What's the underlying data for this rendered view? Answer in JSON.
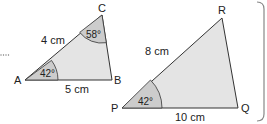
{
  "figure": {
    "triangle1": {
      "vertices": {
        "a": "A",
        "b": "B",
        "c": "C"
      },
      "sides": {
        "ac": "4 cm",
        "ab": "5 cm"
      },
      "angles": {
        "a": "42°",
        "c": "58°"
      }
    },
    "triangle2": {
      "vertices": {
        "p": "P",
        "q": "Q",
        "r": "R"
      },
      "sides": {
        "pr": "8 cm",
        "pq": "10 cm"
      },
      "angles": {
        "p": "42°"
      }
    },
    "colors": {
      "fill": "#e4e4e4",
      "arc_fill": "#cccccc",
      "stroke": "#333333",
      "panel_border": "#888888"
    }
  }
}
